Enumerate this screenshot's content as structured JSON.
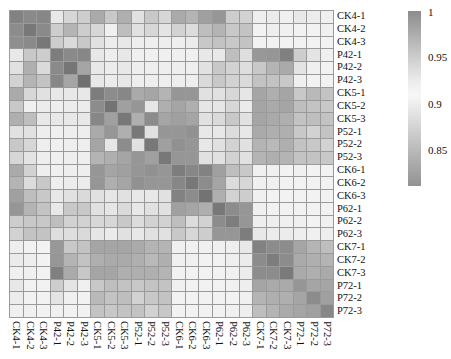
{
  "chart_data": {
    "type": "heatmap",
    "title": "",
    "xlabel": "",
    "ylabel": "",
    "labels": [
      "CK4-1",
      "CK4-2",
      "CK4-3",
      "P42-1",
      "P42-2",
      "P42-3",
      "CK5-1",
      "CK5-2",
      "CK5-3",
      "P52-1",
      "P52-2",
      "P52-3",
      "CK6-1",
      "CK6-2",
      "CK6-3",
      "P62-1",
      "P62-2",
      "P62-3",
      "CK7-1",
      "CK7-2",
      "CK7-3",
      "P72-1",
      "P72-2",
      "P72-3"
    ],
    "row_labels": [
      "CK4-1",
      "CK4-2",
      "CK4-3",
      "P42-1",
      "P42-2",
      "P42-3",
      "CK5-1",
      "CK5-2",
      "CK5-3",
      "P52-1",
      "P52-2",
      "P52-3",
      "CK6-1",
      "CK6-2",
      "CK6-3",
      "P62-1",
      "P62-2",
      "P62-3",
      "CK7-1",
      "CK7-2",
      "CK7-3",
      "P72-1",
      "P72-2",
      "P72-3"
    ],
    "col_labels": [
      "CK4-1",
      "CK4-2",
      "CK4-3",
      "P42-1",
      "P42-2",
      "P42-3",
      "CK5-1",
      "CK5-2",
      "CK5-3",
      "P52-1",
      "P52-2",
      "P52-3",
      "CK6-1",
      "CK6-2",
      "CK6-3",
      "P62-1",
      "P62-2",
      "P62-3",
      "CK7-1",
      "CK7-2",
      "CK7-3",
      "P72-1",
      "P72-2",
      "P72-3"
    ],
    "colorbar": {
      "ticks": [
        "1",
        "0.95",
        "0.9",
        "0.85"
      ],
      "range_approx": [
        0.82,
        1.0
      ],
      "scheme": "diverging grey: dark at 1, white near 0.93, dark again at low values"
    },
    "grey_levels": [
      [
        130,
        138,
        135,
        232,
        215,
        205,
        170,
        200,
        175,
        225,
        200,
        215,
        170,
        180,
        160,
        150,
        205,
        210,
        238,
        235,
        240,
        232,
        236,
        240
      ],
      [
        140,
        120,
        138,
        205,
        180,
        205,
        215,
        240,
        190,
        225,
        215,
        228,
        210,
        220,
        190,
        180,
        200,
        195,
        242,
        238,
        240,
        242,
        242,
        240
      ],
      [
        142,
        138,
        120,
        205,
        218,
        200,
        225,
        236,
        232,
        238,
        238,
        238,
        238,
        236,
        200,
        195,
        200,
        195,
        242,
        242,
        242,
        242,
        242,
        242
      ],
      [
        232,
        200,
        205,
        125,
        138,
        135,
        232,
        238,
        232,
        240,
        240,
        240,
        240,
        240,
        232,
        232,
        190,
        222,
        152,
        150,
        128,
        205,
        228,
        240
      ],
      [
        225,
        175,
        218,
        138,
        118,
        165,
        232,
        236,
        232,
        238,
        238,
        238,
        238,
        238,
        225,
        200,
        210,
        222,
        200,
        180,
        170,
        228,
        240,
        242
      ],
      [
        210,
        180,
        195,
        135,
        165,
        112,
        232,
        236,
        232,
        238,
        238,
        238,
        238,
        238,
        218,
        200,
        210,
        218,
        195,
        195,
        200,
        240,
        242,
        242
      ],
      [
        170,
        215,
        225,
        232,
        232,
        232,
        125,
        140,
        135,
        170,
        165,
        180,
        150,
        150,
        225,
        225,
        215,
        230,
        165,
        175,
        165,
        200,
        185,
        195
      ],
      [
        200,
        240,
        236,
        238,
        236,
        236,
        140,
        115,
        160,
        150,
        230,
        175,
        165,
        175,
        230,
        230,
        215,
        235,
        165,
        170,
        165,
        190,
        195,
        200
      ],
      [
        175,
        190,
        232,
        232,
        232,
        232,
        135,
        160,
        120,
        175,
        140,
        165,
        160,
        165,
        225,
        218,
        200,
        225,
        165,
        170,
        175,
        195,
        190,
        195
      ],
      [
        225,
        225,
        238,
        240,
        238,
        238,
        170,
        150,
        175,
        120,
        225,
        150,
        150,
        145,
        232,
        232,
        220,
        232,
        170,
        175,
        175,
        200,
        210,
        195
      ],
      [
        200,
        215,
        238,
        240,
        238,
        238,
        165,
        230,
        140,
        225,
        120,
        160,
        145,
        150,
        232,
        225,
        210,
        225,
        180,
        185,
        175,
        195,
        200,
        210
      ],
      [
        215,
        228,
        238,
        240,
        238,
        238,
        180,
        175,
        165,
        150,
        160,
        120,
        150,
        150,
        225,
        225,
        210,
        225,
        180,
        175,
        180,
        195,
        195,
        200
      ],
      [
        170,
        210,
        238,
        240,
        238,
        238,
        150,
        165,
        160,
        150,
        145,
        150,
        125,
        135,
        130,
        160,
        190,
        200,
        240,
        240,
        242,
        240,
        242,
        242
      ],
      [
        180,
        220,
        200,
        238,
        236,
        236,
        150,
        175,
        165,
        145,
        150,
        150,
        135,
        120,
        140,
        165,
        220,
        215,
        240,
        240,
        242,
        242,
        242,
        242
      ],
      [
        160,
        190,
        200,
        232,
        225,
        218,
        225,
        230,
        225,
        232,
        232,
        225,
        130,
        140,
        115,
        175,
        210,
        205,
        240,
        242,
        242,
        242,
        242,
        242
      ],
      [
        150,
        180,
        195,
        232,
        200,
        200,
        225,
        230,
        218,
        232,
        225,
        225,
        160,
        165,
        175,
        120,
        140,
        150,
        240,
        242,
        242,
        242,
        242,
        242
      ],
      [
        205,
        200,
        200,
        190,
        210,
        210,
        215,
        215,
        200,
        220,
        210,
        210,
        190,
        220,
        210,
        140,
        125,
        150,
        238,
        238,
        240,
        240,
        242,
        240
      ],
      [
        210,
        195,
        195,
        222,
        222,
        218,
        230,
        235,
        225,
        232,
        225,
        225,
        200,
        215,
        205,
        150,
        150,
        125,
        232,
        236,
        236,
        238,
        240,
        238
      ],
      [
        238,
        242,
        242,
        152,
        200,
        195,
        165,
        165,
        165,
        170,
        180,
        180,
        240,
        240,
        240,
        240,
        238,
        232,
        130,
        140,
        140,
        165,
        180,
        190
      ],
      [
        235,
        238,
        242,
        150,
        180,
        195,
        175,
        170,
        170,
        175,
        185,
        175,
        240,
        240,
        242,
        242,
        238,
        236,
        140,
        125,
        140,
        170,
        175,
        180
      ],
      [
        240,
        240,
        242,
        128,
        170,
        200,
        165,
        165,
        175,
        175,
        175,
        180,
        242,
        242,
        242,
        242,
        240,
        236,
        140,
        140,
        122,
        170,
        175,
        170
      ],
      [
        232,
        242,
        242,
        205,
        228,
        240,
        200,
        190,
        195,
        200,
        195,
        195,
        240,
        242,
        242,
        242,
        240,
        238,
        165,
        170,
        170,
        150,
        165,
        165
      ],
      [
        236,
        242,
        242,
        228,
        240,
        242,
        185,
        195,
        190,
        210,
        200,
        195,
        242,
        242,
        242,
        242,
        242,
        240,
        180,
        175,
        175,
        165,
        140,
        160
      ],
      [
        240,
        240,
        242,
        240,
        242,
        242,
        195,
        200,
        195,
        195,
        210,
        200,
        242,
        242,
        242,
        242,
        240,
        238,
        190,
        180,
        170,
        165,
        160,
        135
      ]
    ]
  },
  "colorbar_ticks": {
    "t1": "1",
    "t095": "0.95",
    "t09": "0.9",
    "t085": "0.85"
  }
}
